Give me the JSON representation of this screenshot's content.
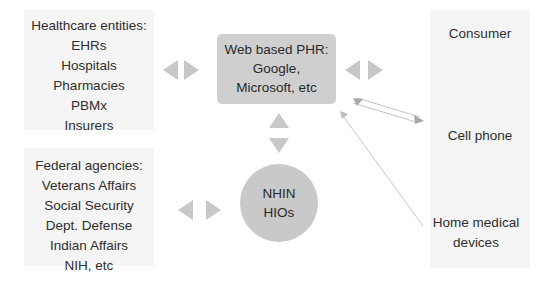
{
  "diagram": {
    "nodes": {
      "healthcare": {
        "title": "Healthcare entities:",
        "items": [
          "EHRs",
          "Hospitals",
          "Pharmacies",
          "PBMx",
          "Insurers"
        ]
      },
      "federal": {
        "title": "Federal agencies:",
        "items": [
          "Veterans Affairs",
          "Social Security",
          "Dept. Defense",
          "Indian Affairs",
          "NIH, etc"
        ]
      },
      "phr": {
        "lines": [
          "Web based PHR:",
          "Google,",
          "Microsoft, etc"
        ]
      },
      "nhin": {
        "lines": [
          "NHIN",
          "HIOs"
        ]
      },
      "consumer": {
        "title": "Consumer",
        "cell_phone": "Cell phone",
        "home_devices": "Home medical devices"
      }
    },
    "edges": [
      {
        "from": "healthcare",
        "to": "phr",
        "type": "bidirectional-block-arrow"
      },
      {
        "from": "phr",
        "to": "consumer",
        "type": "bidirectional-block-arrow"
      },
      {
        "from": "phr",
        "to": "nhin",
        "type": "bidirectional-block-arrow"
      },
      {
        "from": "federal",
        "to": "nhin",
        "type": "bidirectional-block-arrow"
      },
      {
        "from": "phr",
        "to": "cell_phone",
        "type": "bidirectional-line-arrow"
      },
      {
        "from": "home_devices",
        "to": "phr",
        "type": "line-arrow"
      }
    ],
    "colors": {
      "box_fill": "#f5f5f5",
      "phr_fill": "#cfcfcf",
      "nhin_fill": "#c9c9c9",
      "arrow_fill": "#c8c8c8",
      "text": "#2e2e2e"
    }
  }
}
